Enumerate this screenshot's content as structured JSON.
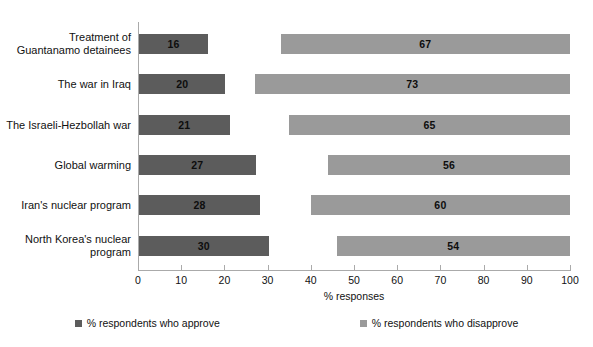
{
  "chart_data": {
    "type": "bar",
    "title": "Percentage approving and disapproving",
    "xlabel": "% responses",
    "ylabel": "",
    "xlim": [
      0,
      100
    ],
    "xticks": [
      0,
      10,
      20,
      30,
      40,
      50,
      60,
      70,
      80,
      90,
      100
    ],
    "grid": false,
    "orientation": "horizontal",
    "legend_position": "bottom",
    "categories": [
      "Treatment of Guantanamo detainees",
      "The war in Iraq",
      "The Israeli-Hezbollah war",
      "Global warming",
      "Iran's nuclear program",
      "North Korea's nuclear program"
    ],
    "series": [
      {
        "name": "% respondents who approve",
        "color": "#5c5c5c",
        "align": "left",
        "values": [
          16,
          20,
          21,
          27,
          28,
          30
        ]
      },
      {
        "name": "% respondents who disapprove",
        "color": "#9a9a9a",
        "align": "right",
        "values": [
          67,
          73,
          65,
          56,
          60,
          54
        ]
      }
    ]
  },
  "axis": {
    "tick_labels": [
      "0",
      "10",
      "20",
      "30",
      "40",
      "50",
      "60",
      "70",
      "80",
      "90",
      "100"
    ],
    "x_title": "% responses"
  },
  "rows": [
    {
      "label": "Treatment of Guantanamo detainees",
      "approve": "16",
      "disapprove": "67"
    },
    {
      "label": "The war in Iraq",
      "approve": "20",
      "disapprove": "73"
    },
    {
      "label": "The Israeli-Hezbollah war",
      "approve": "21",
      "disapprove": "65"
    },
    {
      "label": "Global warming",
      "approve": "27",
      "disapprove": "56"
    },
    {
      "label": "Iran's nuclear program",
      "approve": "28",
      "disapprove": "60"
    },
    {
      "label": "North Korea's nuclear program",
      "approve": "30",
      "disapprove": "54"
    }
  ],
  "legend": {
    "approve_label": "% respondents who approve",
    "disapprove_label": "% respondents who disapprove",
    "approve_color": "#5c5c5c",
    "disapprove_color": "#9a9a9a"
  },
  "title": {
    "text": "Percentage approving and disapproving"
  }
}
